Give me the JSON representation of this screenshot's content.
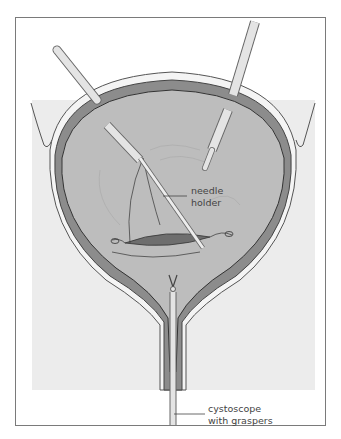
{
  "figure": {
    "labels": {
      "needle_holder": [
        "needle",
        "holder"
      ],
      "cystoscope": [
        "cystoscope",
        "with graspers"
      ]
    },
    "colors": {
      "frame": "#7a7a7a",
      "background_region": "#ececec",
      "bladder_interior": "#bdbdbd",
      "bladder_wall": "#8c8c8c",
      "outer_layer": "#f2f2f2",
      "incision": "#6e6e6e",
      "instrument": "#e4e4e4",
      "label_text": "#444444"
    }
  }
}
